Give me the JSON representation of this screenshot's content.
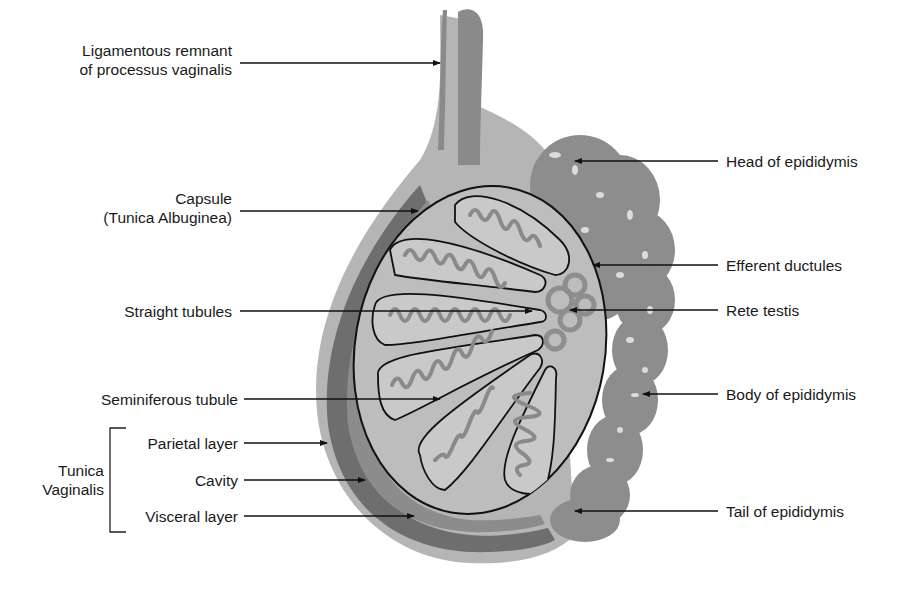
{
  "diagram": {
    "colors": {
      "background": "#ffffff",
      "light_tissue": "#b9b9b9",
      "mid_tissue": "#8e8e8e",
      "dark_tissue": "#6f6f6f",
      "tubule_fill": "#c9c9c9",
      "tubule_coil": "#8a8a8a",
      "outline": "#111111",
      "text": "#1a1a1a"
    },
    "labels_left": [
      {
        "id": "ligamentous",
        "line1": "Ligamentous remnant",
        "line2": "of processus vaginalis"
      },
      {
        "id": "capsule",
        "line1": "Capsule",
        "line2": "(Tunica Albuginea)"
      },
      {
        "id": "straight",
        "line1": "Straight tubules"
      },
      {
        "id": "seminiferous",
        "line1": "Seminiferous tubule"
      },
      {
        "id": "parietal",
        "line1": "Parietal layer"
      },
      {
        "id": "cavity",
        "line1": "Cavity"
      },
      {
        "id": "visceral",
        "line1": "Visceral layer"
      }
    ],
    "group_label": {
      "line1": "Tunica",
      "line2": "Vaginalis"
    },
    "labels_right": [
      {
        "id": "head",
        "line1": "Head of epididymis"
      },
      {
        "id": "efferent",
        "line1": "Efferent ductules"
      },
      {
        "id": "rete",
        "line1": "Rete testis"
      },
      {
        "id": "body",
        "line1": "Body of epididymis"
      },
      {
        "id": "tail",
        "line1": "Tail of epididymis"
      }
    ]
  }
}
